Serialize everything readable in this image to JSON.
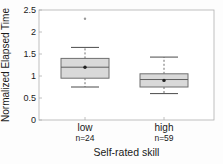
{
  "chart_data": {
    "type": "box",
    "title": "",
    "ylabel": "Normalized Elapsed Time",
    "xlabel": "Self-rated skill",
    "ylim": [
      0,
      2.5
    ],
    "yticks": [
      0,
      0.5,
      1,
      1.5,
      2,
      2.5
    ],
    "grid": false,
    "legend": false,
    "groups": [
      {
        "label": "low",
        "n_label": "n=24",
        "n": 24,
        "whisker_low": 0.75,
        "q1": 0.95,
        "median": 1.2,
        "q3": 1.4,
        "whisker_high": 1.65,
        "mean": 1.2,
        "outliers": [
          2.3
        ]
      },
      {
        "label": "high",
        "n_label": "n=59",
        "n": 59,
        "whisker_low": 0.6,
        "q1": 0.75,
        "median": 0.92,
        "q3": 1.05,
        "whisker_high": 1.43,
        "mean": 0.9,
        "outliers": []
      }
    ],
    "style": {
      "box_fill": "#d9d9d9",
      "box_stroke": "#6f6f6f",
      "median_color": "#5f5f5f",
      "whisker_color": "#4a4a4a",
      "mean_color": "#222222",
      "outlier_color": "#9a9a9a",
      "frame_color": "#b0b0b0",
      "text_color": "#1a1a1a"
    }
  }
}
